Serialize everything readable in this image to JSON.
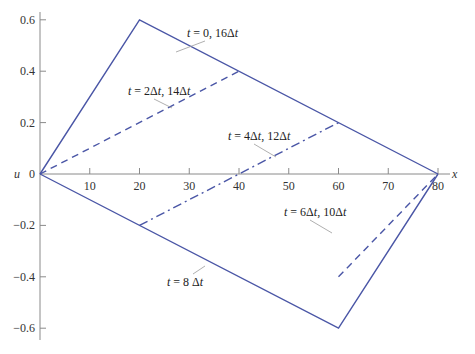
{
  "chart_data": {
    "type": "line",
    "title": "",
    "xlabel": "x",
    "ylabel": "u",
    "xlim": [
      0,
      82
    ],
    "ylim": [
      -0.63,
      0.63
    ],
    "x_ticks": [
      10,
      20,
      30,
      40,
      50,
      60,
      70,
      80
    ],
    "y_ticks": [
      0.6,
      0.4,
      0.2,
      0,
      -0.2,
      -0.4,
      -0.6
    ],
    "y_tick_labels": [
      "0.6",
      "0.4",
      "0.2",
      "0",
      "−0.2",
      "−0.4",
      "−0.6"
    ],
    "grid": false,
    "legend": "none (inline annotations)",
    "line_color": "#4a56a6",
    "series": [
      {
        "name": "t = 0, 16Δt",
        "style": "solid",
        "x": [
          0,
          20,
          80
        ],
        "y": [
          0,
          0.6,
          0
        ]
      },
      {
        "name": "t = 2Δt, 14Δt",
        "style": "dashed",
        "x": [
          0,
          40
        ],
        "y": [
          0,
          0.4
        ]
      },
      {
        "name": "t = 4Δt, 12Δt",
        "style": "dashdot",
        "x": [
          20,
          60
        ],
        "y": [
          -0.2,
          0.2
        ]
      },
      {
        "name": "t = 6Δt, 10Δt",
        "style": "dashed",
        "x": [
          60,
          80
        ],
        "y": [
          -0.4,
          0
        ]
      },
      {
        "name": "t = 8 Δt",
        "style": "solid",
        "x": [
          0,
          60,
          80
        ],
        "y": [
          0,
          -0.6,
          0
        ]
      }
    ],
    "annotations": [
      {
        "text": "t = 0, 16Δt",
        "label_xy": [
          187,
          37
        ],
        "point_xy": [
          176,
          52
        ]
      },
      {
        "text": "t = 2Δt, 14Δt",
        "label_xy": [
          128,
          95
        ],
        "point_xy": [
          172,
          108
        ]
      },
      {
        "text": "t = 4Δt, 12Δt",
        "label_xy": [
          228,
          140
        ],
        "point_xy": [
          276,
          157
        ]
      },
      {
        "text": "t = 6Δt, 10Δt",
        "label_xy": [
          284,
          216
        ],
        "point_xy": [
          332,
          233
        ]
      },
      {
        "text": "t = 8 Δt",
        "label_xy": [
          167,
          286
        ],
        "point_xy": [
          205,
          266
        ]
      }
    ]
  }
}
